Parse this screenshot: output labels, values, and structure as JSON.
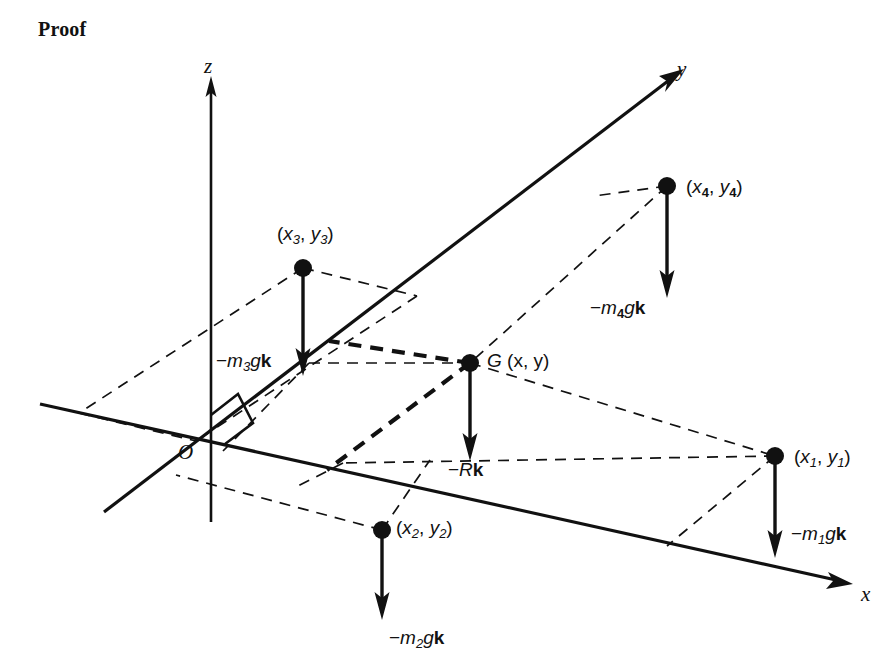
{
  "figure": {
    "heading": "Proof",
    "axes": {
      "z_label": "z",
      "y_label": "y",
      "x_label": "x",
      "origin_label": "O",
      "right_angle_marker": true
    },
    "centroid": {
      "name": "G",
      "label_G": "G",
      "label_coords_open": "(",
      "label_x": "x",
      "label_comma": ",",
      "label_y": "y",
      "label_coords_close": ")",
      "force_prefix": "−",
      "force_symbol": "R",
      "force_unit": "k",
      "force_label": "−Rk"
    },
    "masses": [
      {
        "id": "m1",
        "point_label": "(x₁, y₁)",
        "coord_open": "(",
        "coord_x": "x",
        "coord_sub": "1",
        "coord_comma": ",",
        "coord_y": "y",
        "coord_close": ")",
        "force_prefix": "−",
        "force_m": "m",
        "force_sub": "1",
        "force_g": "g",
        "force_k": "k",
        "force_label": "−m₁gk"
      },
      {
        "id": "m2",
        "point_label": "(x₂, y₂)",
        "coord_open": "(",
        "coord_x": "x",
        "coord_sub": "2",
        "coord_comma": ",",
        "coord_y": "y",
        "coord_close": ")",
        "force_prefix": "−",
        "force_m": "m",
        "force_sub": "2",
        "force_g": "g",
        "force_k": "k",
        "force_label": "−m₂gk"
      },
      {
        "id": "m3",
        "point_label": "(x₃, y₃)",
        "coord_open": "(",
        "coord_x": "x",
        "coord_sub": "3",
        "coord_comma": ",",
        "coord_y": "y",
        "coord_close": ")",
        "force_prefix": "−",
        "force_m": "m",
        "force_sub": "3",
        "force_g": "g",
        "force_k": "k",
        "force_label": "−m₃gk"
      },
      {
        "id": "m4",
        "point_label": "(x₄, y₄)",
        "coord_open": "(",
        "coord_x": "x",
        "coord_sub": "4",
        "coord_comma": ",",
        "coord_y": "y",
        "coord_close": ")",
        "force_prefix": "−",
        "force_m": "m",
        "force_sub": "4",
        "force_g": "g",
        "force_k": "k",
        "force_label": "−m₄gk"
      }
    ],
    "colors": {
      "ink": "#111111",
      "background": "#ffffff"
    }
  }
}
